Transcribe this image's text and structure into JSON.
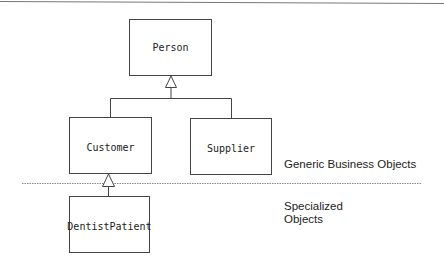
{
  "diagram": {
    "type": "uml-class-inheritance",
    "classes": [
      {
        "id": "person",
        "name": "Person"
      },
      {
        "id": "customer",
        "name": "Customer"
      },
      {
        "id": "supplier",
        "name": "Supplier"
      },
      {
        "id": "dentist_patient",
        "name": "DentistPatient"
      }
    ],
    "relationships": [
      {
        "type": "generalization",
        "from": "Customer",
        "to": "Person"
      },
      {
        "type": "generalization",
        "from": "Supplier",
        "to": "Person"
      },
      {
        "type": "generalization",
        "from": "DentistPatient",
        "to": "Customer"
      }
    ],
    "layers": {
      "generic": "Generic Business Objects",
      "specialized_line1": "Specialized",
      "specialized_line2": "Objects"
    },
    "colors": {
      "stroke": "#444444",
      "divider": "#888888",
      "text": "#222222"
    }
  }
}
